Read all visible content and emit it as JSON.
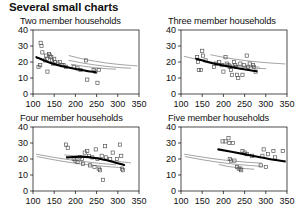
{
  "page": {
    "title": "Several small charts"
  },
  "chart_data": [
    {
      "id": "two-member",
      "type": "scatter",
      "title": "Two member households",
      "xlabel": "",
      "ylabel": "",
      "xlim": [
        100,
        350
      ],
      "ylim": [
        0,
        40
      ],
      "xticks": [
        100,
        150,
        200,
        250,
        300,
        350
      ],
      "yticks": [
        0,
        10,
        20,
        30,
        40
      ],
      "xtick_labels": [
        "100",
        "150",
        "200",
        "250",
        "300",
        "350"
      ],
      "ytick_labels": [
        "0",
        "10",
        "20",
        "30",
        "40"
      ],
      "grid": false,
      "legend": "none",
      "points": [
        [
          118,
          32
        ],
        [
          120,
          30
        ],
        [
          122,
          26
        ],
        [
          117,
          18
        ],
        [
          113,
          17
        ],
        [
          128,
          21
        ],
        [
          131,
          24
        ],
        [
          133,
          22
        ],
        [
          134,
          14
        ],
        [
          138,
          25
        ],
        [
          140,
          24
        ],
        [
          143,
          23
        ],
        [
          145,
          21
        ],
        [
          147,
          19
        ],
        [
          150,
          22
        ],
        [
          152,
          20
        ],
        [
          158,
          19
        ],
        [
          163,
          20
        ],
        [
          168,
          18
        ],
        [
          172,
          18
        ],
        [
          178,
          17
        ],
        [
          196,
          17
        ],
        [
          205,
          16
        ],
        [
          212,
          15
        ],
        [
          225,
          21
        ],
        [
          228,
          9
        ],
        [
          243,
          15
        ],
        [
          247,
          14
        ],
        [
          252,
          7
        ],
        [
          255,
          15
        ]
      ],
      "fit_curve": {
        "name": "fitted-curve",
        "style": "thick-black",
        "points": [
          [
            108,
            23
          ],
          [
            140,
            19.5
          ],
          [
            175,
            17
          ],
          [
            210,
            15.2
          ],
          [
            248,
            13.6
          ]
        ]
      },
      "reference_curves": [
        {
          "name": "upper-band",
          "style": "thin-grey",
          "points": [
            [
              185,
              24
            ],
            [
              225,
              21.5
            ],
            [
              270,
              19.5
            ],
            [
              310,
              18.3
            ],
            [
              345,
              17.6
            ]
          ]
        },
        {
          "name": "middle-band",
          "style": "thin-grey",
          "points": [
            [
              185,
              21
            ],
            [
              225,
              19
            ],
            [
              265,
              17.5
            ],
            [
              300,
              16.6
            ],
            [
              330,
              16.1
            ]
          ]
        },
        {
          "name": "lower-band",
          "style": "thin-grey",
          "points": [
            [
              190,
              18.5
            ],
            [
              230,
              17
            ],
            [
              265,
              16
            ],
            [
              295,
              15.5
            ]
          ]
        }
      ]
    },
    {
      "id": "three-member",
      "type": "scatter",
      "title": "Three member households",
      "xlabel": "",
      "ylabel": "",
      "xlim": [
        100,
        350
      ],
      "ylim": [
        0,
        40
      ],
      "xticks": [
        100,
        150,
        200,
        250,
        300,
        350
      ],
      "yticks": [
        0,
        10,
        20,
        30,
        40
      ],
      "xtick_labels": [
        "100",
        "150",
        "200",
        "250",
        "300",
        "350"
      ],
      "ytick_labels": [
        "0",
        "10",
        "20",
        "30",
        "40"
      ],
      "grid": false,
      "legend": "none",
      "points": [
        [
          138,
          23
        ],
        [
          140,
          20
        ],
        [
          142,
          15
        ],
        [
          147,
          15
        ],
        [
          150,
          27
        ],
        [
          152,
          24
        ],
        [
          158,
          21
        ],
        [
          178,
          17
        ],
        [
          183,
          19
        ],
        [
          190,
          20
        ],
        [
          196,
          18
        ],
        [
          200,
          14
        ],
        [
          205,
          23
        ],
        [
          208,
          19
        ],
        [
          212,
          18
        ],
        [
          215,
          17
        ],
        [
          218,
          15
        ],
        [
          220,
          12
        ],
        [
          225,
          20
        ],
        [
          228,
          18
        ],
        [
          230,
          17
        ],
        [
          232,
          12
        ],
        [
          235,
          10
        ],
        [
          240,
          19
        ],
        [
          245,
          12
        ],
        [
          248,
          18
        ],
        [
          255,
          24
        ],
        [
          258,
          17
        ],
        [
          262,
          19
        ],
        [
          270,
          18
        ],
        [
          272,
          17
        ],
        [
          276,
          14
        ]
      ],
      "fit_curve": {
        "name": "fitted-curve",
        "style": "thick-black",
        "points": [
          [
            136,
            22
          ],
          [
            170,
            19.5
          ],
          [
            205,
            17.5
          ],
          [
            240,
            15.8
          ],
          [
            278,
            14.2
          ]
        ]
      },
      "reference_curves": [
        {
          "name": "upper-band",
          "style": "thin-grey",
          "points": [
            [
              170,
              24.5
            ],
            [
              210,
              22.5
            ],
            [
              255,
              20.8
            ],
            [
              300,
              19.6
            ],
            [
              345,
              18.8
            ]
          ]
        },
        {
          "name": "middle-band",
          "style": "thin-grey",
          "points": [
            [
              108,
              23.5
            ],
            [
              150,
              21
            ],
            [
              195,
              19
            ],
            [
              240,
              17.6
            ],
            [
              285,
              16.8
            ]
          ]
        },
        {
          "name": "lower-band",
          "style": "thin-grey",
          "points": [
            [
              175,
              19
            ],
            [
              215,
              17.5
            ],
            [
              260,
              16.4
            ],
            [
              300,
              15.8
            ]
          ]
        }
      ]
    },
    {
      "id": "four-member",
      "type": "scatter",
      "title": "Four member households",
      "xlabel": "",
      "ylabel": "",
      "xlim": [
        100,
        350
      ],
      "ylim": [
        0,
        40
      ],
      "xticks": [
        100,
        150,
        200,
        250,
        300,
        350
      ],
      "yticks": [
        0,
        10,
        20,
        30,
        40
      ],
      "xtick_labels": [
        "100",
        "150",
        "200",
        "250",
        "300",
        "350"
      ],
      "ytick_labels": [
        "0",
        "10",
        "20",
        "30",
        "40"
      ],
      "grid": false,
      "legend": "none",
      "points": [
        [
          178,
          29
        ],
        [
          182,
          27
        ],
        [
          196,
          20
        ],
        [
          200,
          19
        ],
        [
          205,
          18
        ],
        [
          210,
          21
        ],
        [
          215,
          20
        ],
        [
          218,
          17
        ],
        [
          222,
          24
        ],
        [
          228,
          25
        ],
        [
          232,
          22
        ],
        [
          235,
          16
        ],
        [
          240,
          21
        ],
        [
          245,
          15
        ],
        [
          248,
          26
        ],
        [
          252,
          20
        ],
        [
          255,
          14
        ],
        [
          258,
          13
        ],
        [
          262,
          22
        ],
        [
          265,
          7
        ],
        [
          270,
          28
        ],
        [
          272,
          21
        ],
        [
          282,
          20
        ],
        [
          288,
          24
        ],
        [
          298,
          20
        ],
        [
          305,
          29
        ],
        [
          308,
          22
        ],
        [
          310,
          14
        ],
        [
          312,
          13
        ]
      ],
      "fit_curve": {
        "name": "fitted-curve",
        "style": "thick-black",
        "points": [
          [
            180,
            21
          ],
          [
            215,
            21.5
          ],
          [
            250,
            20.5
          ],
          [
            285,
            18.5
          ],
          [
            315,
            16.3
          ]
        ]
      },
      "reference_curves": [
        {
          "name": "upper-band",
          "style": "thin-grey",
          "points": [
            [
              175,
              22.5
            ],
            [
              215,
              21.5
            ],
            [
              260,
              20
            ],
            [
              300,
              18.5
            ],
            [
              330,
              17.6
            ]
          ]
        },
        {
          "name": "middle-band",
          "style": "thin-grey",
          "points": [
            [
              108,
              23
            ],
            [
              150,
              21
            ],
            [
              195,
              19.2
            ],
            [
              245,
              17.6
            ],
            [
              295,
              16.4
            ]
          ]
        },
        {
          "name": "lower-band",
          "style": "thin-grey",
          "points": [
            [
              110,
              21.5
            ],
            [
              160,
              19
            ],
            [
              210,
              17
            ],
            [
              260,
              15.6
            ],
            [
              310,
              14.6
            ]
          ]
        }
      ]
    },
    {
      "id": "five-member",
      "type": "scatter",
      "title": "Five member households",
      "xlabel": "",
      "ylabel": "",
      "xlim": [
        100,
        350
      ],
      "ylim": [
        0,
        40
      ],
      "xticks": [
        100,
        150,
        200,
        250,
        300,
        350
      ],
      "yticks": [
        0,
        10,
        20,
        30,
        40
      ],
      "xtick_labels": [
        "100",
        "150",
        "200",
        "250",
        "300",
        "350"
      ],
      "ytick_labels": [
        "0",
        "10",
        "20",
        "30",
        "40"
      ],
      "grid": false,
      "legend": "none",
      "points": [
        [
          198,
          31
        ],
        [
          205,
          31
        ],
        [
          212,
          33
        ],
        [
          214,
          30
        ],
        [
          222,
          30
        ],
        [
          215,
          20
        ],
        [
          218,
          19
        ],
        [
          226,
          19
        ],
        [
          232,
          15
        ],
        [
          236,
          14
        ],
        [
          240,
          14
        ],
        [
          242,
          13
        ],
        [
          245,
          25
        ],
        [
          250,
          24
        ],
        [
          255,
          23
        ],
        [
          268,
          22
        ],
        [
          288,
          16
        ],
        [
          292,
          22
        ],
        [
          295,
          26
        ],
        [
          300,
          15
        ],
        [
          305,
          23
        ],
        [
          318,
          25
        ],
        [
          322,
          21
        ],
        [
          340,
          25
        ]
      ],
      "fit_curve": {
        "name": "fitted-curve",
        "style": "thick-black",
        "points": [
          [
            188,
            26
          ],
          [
            225,
            24.2
          ],
          [
            265,
            22.2
          ],
          [
            305,
            20.2
          ],
          [
            345,
            18.5
          ]
        ]
      },
      "reference_curves": [
        {
          "name": "upper-band",
          "style": "thin-grey",
          "points": [
            [
              108,
              23
            ],
            [
              155,
              21
            ],
            [
              200,
              19.4
            ],
            [
              245,
              18.2
            ],
            [
              290,
              17.4
            ]
          ]
        },
        {
          "name": "middle-band",
          "style": "thin-grey",
          "points": [
            [
              110,
              21.5
            ],
            [
              158,
              19.2
            ],
            [
              205,
              17.4
            ],
            [
              250,
              16.2
            ],
            [
              292,
              15.4
            ]
          ]
        },
        {
          "name": "lower-band",
          "style": "thin-grey",
          "points": [
            [
              190,
              16.5
            ],
            [
              215,
              15.2
            ],
            [
              245,
              14.2
            ],
            [
              272,
              13.6
            ]
          ]
        }
      ]
    }
  ]
}
